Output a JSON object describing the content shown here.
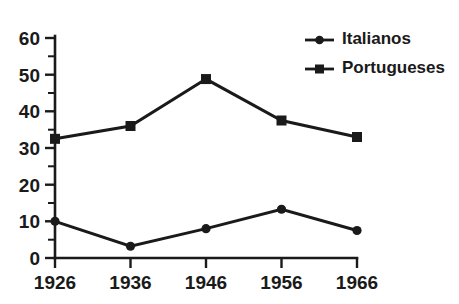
{
  "chart_data": {
    "type": "line",
    "title": "",
    "subtitle": "",
    "xlabel": "",
    "ylabel": "",
    "categories": [
      "1926",
      "1936",
      "1946",
      "1956",
      "1966"
    ],
    "x": [
      1926,
      1936,
      1946,
      1956,
      1966
    ],
    "series": [
      {
        "name": "Italianos",
        "marker": "circle",
        "color": "#1a1a1a",
        "values": [
          10,
          3.2,
          8,
          13.3,
          7.5
        ]
      },
      {
        "name": "Portugueses",
        "marker": "square",
        "color": "#1a1a1a",
        "values": [
          32.5,
          36,
          48.8,
          37.5,
          33
        ]
      }
    ],
    "ylim": [
      0,
      60
    ],
    "ytick_labels": [
      "0",
      "10",
      "20",
      "30",
      "40",
      "50",
      "60"
    ],
    "ytick_values": [
      0,
      10,
      20,
      30,
      40,
      50,
      60
    ],
    "yminor_values": [
      5,
      15,
      25,
      35,
      45,
      55
    ],
    "xtick_labels": [
      "1926",
      "1936",
      "1946",
      "1956",
      "1966"
    ],
    "grid": false,
    "legend_position": "top-right",
    "legend_entries": [
      "Italianos",
      "Portugueses"
    ],
    "background_color": "#ffffff",
    "axis_color": "#1a1a1a"
  },
  "legend": {
    "italianos": "Italianos",
    "portugueses": "Portugueses"
  },
  "axes": {
    "y": {
      "t0": "0",
      "t10": "10",
      "t20": "20",
      "t30": "30",
      "t40": "40",
      "t50": "50",
      "t60": "60"
    },
    "x": {
      "t1926": "1926",
      "t1936": "1936",
      "t1946": "1946",
      "t1956": "1956",
      "t1966": "1966"
    }
  }
}
